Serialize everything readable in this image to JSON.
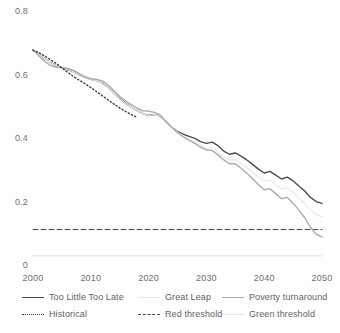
{
  "chart_data": {
    "type": "line",
    "title": "",
    "subtitle": "",
    "xlabel": "",
    "ylabel": "",
    "xlim": [
      2000,
      2050
    ],
    "ylim": [
      0,
      0.8
    ],
    "grid": false,
    "legend_position": "bottom",
    "xticks": [
      "2000",
      "2010",
      "2020",
      "2030",
      "2040",
      "2050"
    ],
    "xtick_values": [
      2000,
      2010,
      2020,
      2030,
      2040,
      2050
    ],
    "yticks": [
      "0",
      "0.2",
      "0.4",
      "0.6",
      "0.8"
    ],
    "ytick_values": [
      0,
      0.2,
      0.4,
      0.6,
      0.8
    ],
    "x": [
      2000,
      2001,
      2002,
      2003,
      2004,
      2005,
      2006,
      2007,
      2008,
      2009,
      2010,
      2011,
      2012,
      2013,
      2014,
      2015,
      2016,
      2017,
      2018,
      2019,
      2020,
      2021,
      2022,
      2023,
      2024,
      2025,
      2026,
      2027,
      2028,
      2029,
      2030,
      2031,
      2032,
      2033,
      2034,
      2035,
      2036,
      2037,
      2038,
      2039,
      2040,
      2041,
      2042,
      2043,
      2044,
      2045,
      2046,
      2047,
      2048,
      2049,
      2050
    ],
    "series": [
      {
        "name": "Too Little Too Late",
        "style": "solid",
        "color": "#4d4d4d",
        "width": 1.4,
        "values": [
          0.68,
          0.668,
          0.654,
          0.641,
          0.631,
          0.624,
          0.618,
          0.612,
          0.603,
          0.594,
          0.588,
          0.584,
          0.576,
          0.562,
          0.545,
          0.528,
          0.513,
          0.5,
          0.489,
          0.48,
          0.474,
          0.477,
          0.472,
          0.455,
          0.437,
          0.424,
          0.415,
          0.408,
          0.402,
          0.392,
          0.386,
          0.39,
          0.379,
          0.362,
          0.352,
          0.356,
          0.346,
          0.334,
          0.32,
          0.305,
          0.293,
          0.298,
          0.286,
          0.274,
          0.28,
          0.268,
          0.252,
          0.236,
          0.216,
          0.203,
          0.197
        ]
      },
      {
        "name": "Great Leap",
        "style": "solid",
        "color": "#e8e8e8",
        "width": 1.2,
        "values": [
          0.68,
          0.668,
          0.654,
          0.641,
          0.631,
          0.624,
          0.618,
          0.612,
          0.603,
          0.594,
          0.588,
          0.584,
          0.576,
          0.562,
          0.545,
          0.528,
          0.513,
          0.5,
          0.489,
          0.48,
          0.474,
          0.477,
          0.472,
          0.455,
          0.437,
          0.422,
          0.41,
          0.4,
          0.392,
          0.38,
          0.372,
          0.374,
          0.36,
          0.344,
          0.334,
          0.336,
          0.324,
          0.31,
          0.296,
          0.28,
          0.268,
          0.27,
          0.256,
          0.242,
          0.246,
          0.232,
          0.214,
          0.196,
          0.176,
          0.162,
          0.154
        ]
      },
      {
        "name": "Poverty turnaround",
        "style": "solid",
        "color": "#ababab",
        "width": 1.4,
        "values": [
          0.68,
          0.662,
          0.644,
          0.632,
          0.626,
          0.625,
          0.622,
          0.616,
          0.606,
          0.596,
          0.59,
          0.588,
          0.583,
          0.57,
          0.552,
          0.534,
          0.52,
          0.508,
          0.497,
          0.489,
          0.488,
          0.484,
          0.476,
          0.456,
          0.436,
          0.42,
          0.407,
          0.396,
          0.386,
          0.374,
          0.366,
          0.364,
          0.35,
          0.334,
          0.322,
          0.322,
          0.308,
          0.292,
          0.275,
          0.256,
          0.24,
          0.243,
          0.228,
          0.212,
          0.216,
          0.198,
          0.176,
          0.152,
          0.122,
          0.1,
          0.092
        ]
      },
      {
        "name": "Historical",
        "style": "dotted",
        "color": "#3a3a3a",
        "width": 1.4,
        "x": [
          2000,
          2001,
          2002,
          2003,
          2004,
          2005,
          2006,
          2007,
          2008,
          2009,
          2010,
          2011,
          2012,
          2013,
          2014,
          2015,
          2016,
          2017,
          2018
        ],
        "values": [
          0.68,
          0.672,
          0.662,
          0.65,
          0.638,
          0.624,
          0.61,
          0.597,
          0.585,
          0.574,
          0.562,
          0.549,
          0.536,
          0.523,
          0.51,
          0.498,
          0.487,
          0.477,
          0.468
        ]
      }
    ],
    "threshold_lines": [
      {
        "name": "Red threshold",
        "style": "dashed",
        "color": "#4d4d4d",
        "width": 1.1,
        "value": 0.115
      },
      {
        "name": "Green threshold",
        "style": "solid",
        "color": "#e4e4e4",
        "width": 1.1,
        "value": 0.032
      }
    ]
  },
  "legend": {
    "rows": [
      [
        {
          "label": "Too Little Too Late",
          "style": "solid",
          "color": "#4d4d4d"
        },
        {
          "label": "Great Leap",
          "style": "solid",
          "color": "#e8e8e8"
        },
        {
          "label": "Poverty turnaround",
          "style": "solid",
          "color": "#ababab"
        }
      ],
      [
        {
          "label": "Historical",
          "style": "dotted",
          "color": "#3a3a3a"
        },
        {
          "label": "Red threshold",
          "style": "dashed",
          "color": "#4d4d4d"
        },
        {
          "label": "Green threshold",
          "style": "solid",
          "color": "#e4e4e4"
        }
      ]
    ]
  }
}
